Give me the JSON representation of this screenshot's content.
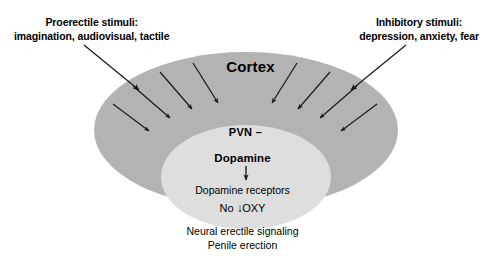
{
  "diagram": {
    "title_region": "central nervous control of penile erection",
    "outer_region": {
      "name": "Cortex",
      "label": "Cortex",
      "fill_color": "#b3b3b3"
    },
    "inner_region": {
      "fill_color": "#dedede",
      "lines": {
        "pvn": "PVN –",
        "dopamine": "Dopamine",
        "receptors": "Dopamine receptors",
        "oxy_prefix": "No",
        "oxy_arrow": "↓",
        "oxy_label": "OXY"
      }
    },
    "stimuli": {
      "left": {
        "line1": "Proerectile stimuli:",
        "line2": "imagination, audiovisual, tactile"
      },
      "right": {
        "line1": "Inhibitory stimuli:",
        "line2": "depression, anxiety, fear"
      }
    },
    "caption": {
      "line1": "Neural erectile signaling",
      "line2": "Penile erection"
    },
    "arrow_color": "#1a1a1a"
  }
}
